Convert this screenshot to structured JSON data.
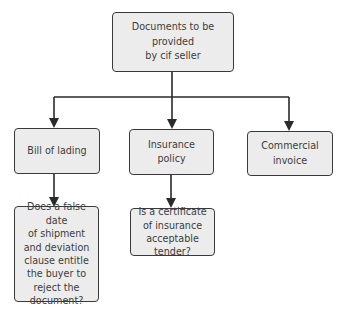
{
  "diagram": {
    "type": "hierarchy",
    "root": {
      "label": "Documents to be provided\nby  cif seller"
    },
    "children": [
      {
        "label": "Bill of lading",
        "question": "Does a false date\nof shipment\nand deviation\nclause entitle\nthe buyer to\nreject the\ndocument?"
      },
      {
        "label": "Insurance policy",
        "question": "Is a certificate\nof insurance\nacceptable tender?"
      },
      {
        "label": "Commercial\ninvoice"
      }
    ],
    "colors": {
      "box_fill": "#ececec",
      "box_border": "#3a3a3a",
      "connector": "#2a2a2a",
      "text": "#3c3c3c"
    }
  }
}
